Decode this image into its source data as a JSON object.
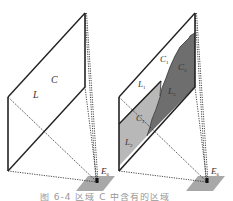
{
  "figure": {
    "left_panel": {
      "label_plane": "C",
      "label_light": "L",
      "label_eye": "E",
      "label_eye_sub": "6"
    },
    "right_panel": {
      "label_c1": "C",
      "label_c1_sub": "1",
      "label_c2": "C",
      "label_c2_sub": "2",
      "label_c3": "C",
      "label_c3_sub": "3",
      "label_l1": "L",
      "label_l1_sub": "1",
      "label_l2": "L",
      "label_l2_sub": "2",
      "label_l3": "L",
      "label_l3_sub": "3",
      "label_eye": "E",
      "label_eye_sub": "6"
    },
    "colors": {
      "stroke": "#222222",
      "light_region": "#b8b8b8",
      "dark_region": "#6e6e6e",
      "platform": "#a8a8a8"
    },
    "caption": "图 6-4 区域 C 中含有的区域"
  }
}
